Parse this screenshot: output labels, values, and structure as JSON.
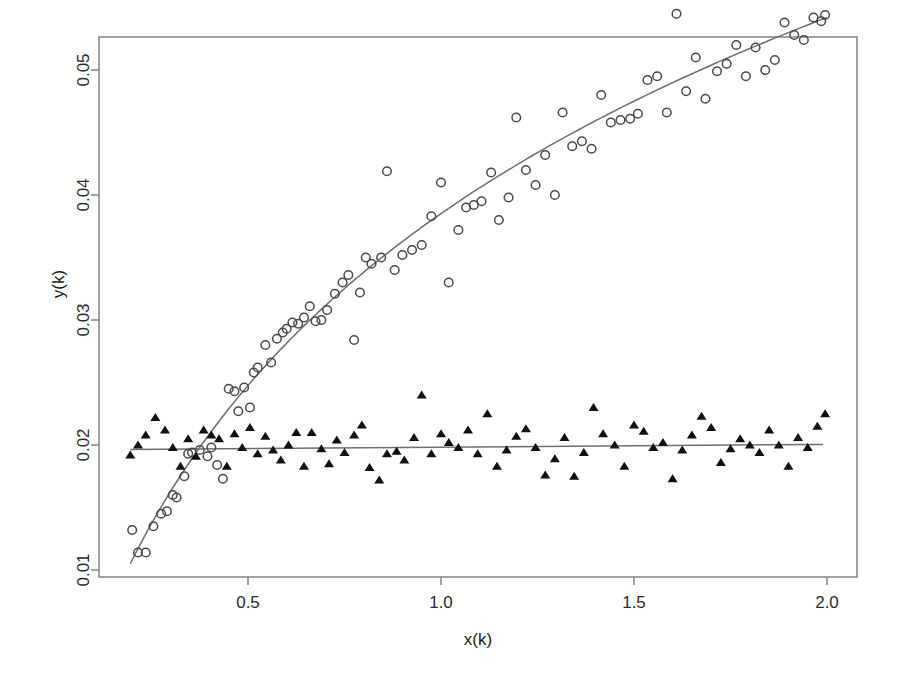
{
  "chart_data": {
    "type": "scatter",
    "title": "",
    "subtitle": "",
    "xlabel": "x(k)",
    "ylabel": "y(k)",
    "xlim": [
      0.17,
      2.05
    ],
    "ylim": [
      0.0098,
      0.0558
    ],
    "xticks": [
      0.5,
      1.0,
      1.5,
      2.0
    ],
    "xtick_labels": [
      "0.5",
      "1.0",
      "1.5",
      "2.0"
    ],
    "yticks": [
      0.01,
      0.02,
      0.03,
      0.04,
      0.05
    ],
    "ytick_labels": [
      "0.01",
      "0.02",
      "0.03",
      "0.04",
      "0.05"
    ],
    "grid": false,
    "legend": "none",
    "frame": "box",
    "colors": {
      "frame": "#8a8a8a",
      "fit_line": "#6e6e6e",
      "circle_marker": "#4a4a4a",
      "triangle_marker": "#111111",
      "background": "#ffffff",
      "text": "#1c1c1c"
    },
    "series": [
      {
        "name": "saturating-response",
        "marker": "open-circle",
        "x": [
          0.2,
          0.215,
          0.235,
          0.255,
          0.275,
          0.29,
          0.305,
          0.315,
          0.335,
          0.345,
          0.355,
          0.375,
          0.395,
          0.405,
          0.42,
          0.435,
          0.45,
          0.465,
          0.475,
          0.49,
          0.505,
          0.515,
          0.525,
          0.545,
          0.56,
          0.575,
          0.59,
          0.6,
          0.615,
          0.63,
          0.645,
          0.66,
          0.675,
          0.69,
          0.705,
          0.725,
          0.745,
          0.76,
          0.775,
          0.79,
          0.805,
          0.82,
          0.845,
          0.86,
          0.88,
          0.9,
          0.925,
          0.95,
          0.975,
          1.0,
          1.02,
          1.045,
          1.065,
          1.085,
          1.105,
          1.13,
          1.15,
          1.175,
          1.195,
          1.22,
          1.245,
          1.27,
          1.295,
          1.315,
          1.34,
          1.365,
          1.39,
          1.415,
          1.44,
          1.465,
          1.49,
          1.51,
          1.535,
          1.56,
          1.585,
          1.61,
          1.635,
          1.66,
          1.685,
          1.715,
          1.74,
          1.765,
          1.79,
          1.815,
          1.84,
          1.865,
          1.89,
          1.915,
          1.94,
          1.965,
          1.985,
          1.995
        ],
        "y": [
          0.0132,
          0.0114,
          0.0114,
          0.0135,
          0.0145,
          0.0147,
          0.016,
          0.0158,
          0.0175,
          0.0193,
          0.0194,
          0.0196,
          0.0191,
          0.0198,
          0.0184,
          0.0173,
          0.0245,
          0.0243,
          0.0227,
          0.0246,
          0.023,
          0.0258,
          0.0262,
          0.028,
          0.0266,
          0.0285,
          0.029,
          0.0293,
          0.0298,
          0.0297,
          0.0302,
          0.0311,
          0.0299,
          0.03,
          0.0308,
          0.0321,
          0.033,
          0.0336,
          0.0284,
          0.0322,
          0.035,
          0.0345,
          0.035,
          0.0419,
          0.034,
          0.0352,
          0.0356,
          0.036,
          0.0383,
          0.041,
          0.033,
          0.0372,
          0.039,
          0.0392,
          0.0395,
          0.0418,
          0.038,
          0.0398,
          0.0462,
          0.042,
          0.0408,
          0.0432,
          0.04,
          0.0466,
          0.0439,
          0.0443,
          0.0437,
          0.048,
          0.0458,
          0.046,
          0.0461,
          0.0465,
          0.0492,
          0.0495,
          0.0466,
          0.0545,
          0.0483,
          0.051,
          0.0477,
          0.0499,
          0.0505,
          0.052,
          0.0495,
          0.0518,
          0.05,
          0.0508,
          0.0538,
          0.0528,
          0.0524,
          0.0542,
          0.0539,
          0.0544
        ],
        "fit": {
          "kind": "saturating-curve",
          "x_start": 0.195,
          "x_end": 2.0,
          "y_start": 0.0105,
          "y_end": 0.0542
        }
      },
      {
        "name": "flat-baseline",
        "marker": "filled-triangle",
        "x": [
          0.195,
          0.215,
          0.235,
          0.26,
          0.285,
          0.305,
          0.325,
          0.345,
          0.365,
          0.385,
          0.405,
          0.425,
          0.445,
          0.465,
          0.485,
          0.505,
          0.525,
          0.545,
          0.565,
          0.585,
          0.605,
          0.625,
          0.645,
          0.665,
          0.69,
          0.71,
          0.73,
          0.75,
          0.775,
          0.795,
          0.815,
          0.84,
          0.86,
          0.885,
          0.905,
          0.93,
          0.95,
          0.975,
          1.0,
          1.02,
          1.045,
          1.07,
          1.095,
          1.12,
          1.145,
          1.17,
          1.195,
          1.22,
          1.245,
          1.27,
          1.295,
          1.32,
          1.345,
          1.37,
          1.395,
          1.42,
          1.45,
          1.475,
          1.5,
          1.525,
          1.55,
          1.575,
          1.6,
          1.625,
          1.65,
          1.675,
          1.7,
          1.725,
          1.75,
          1.775,
          1.8,
          1.825,
          1.85,
          1.875,
          1.9,
          1.925,
          1.95,
          1.975,
          1.995
        ],
        "y": [
          0.0192,
          0.02,
          0.0208,
          0.0222,
          0.0212,
          0.0198,
          0.0183,
          0.0205,
          0.0191,
          0.0212,
          0.0208,
          0.0205,
          0.0183,
          0.0209,
          0.0198,
          0.0214,
          0.0193,
          0.0207,
          0.0196,
          0.0188,
          0.02,
          0.021,
          0.0183,
          0.021,
          0.0197,
          0.0185,
          0.0204,
          0.0194,
          0.0208,
          0.0216,
          0.0182,
          0.0172,
          0.0193,
          0.0195,
          0.0188,
          0.0206,
          0.024,
          0.0193,
          0.0209,
          0.0202,
          0.0198,
          0.0212,
          0.0193,
          0.0225,
          0.0183,
          0.0196,
          0.0207,
          0.0213,
          0.0198,
          0.0176,
          0.0189,
          0.0206,
          0.0175,
          0.0194,
          0.023,
          0.0209,
          0.02,
          0.0183,
          0.0216,
          0.0211,
          0.0198,
          0.0202,
          0.0173,
          0.0196,
          0.0208,
          0.0223,
          0.0214,
          0.0186,
          0.0197,
          0.0205,
          0.02,
          0.0194,
          0.0212,
          0.02,
          0.0183,
          0.0206,
          0.0198,
          0.0215,
          0.0225
        ],
        "fit": {
          "kind": "straight-line",
          "x_start": 0.195,
          "x_end": 1.99,
          "y_start": 0.01965,
          "y_end": 0.02005
        }
      }
    ]
  }
}
